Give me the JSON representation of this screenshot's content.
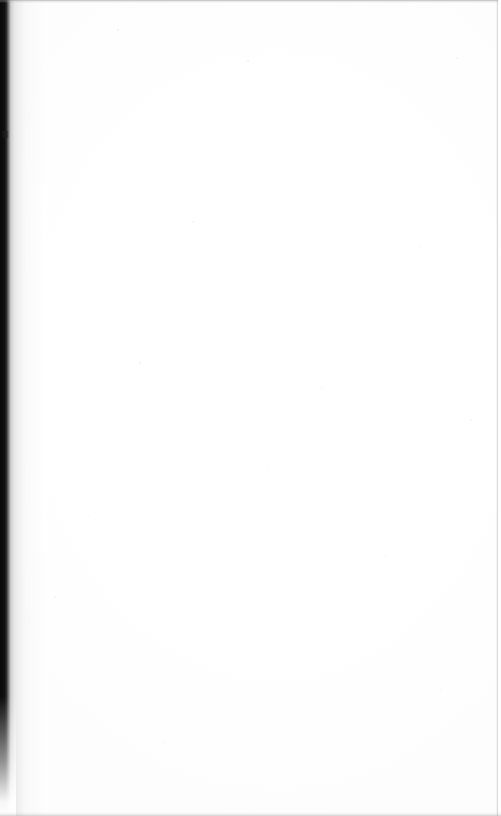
{
  "page": {
    "kind": "scanned-document-page",
    "content_text": "",
    "is_blank": true,
    "width": 501,
    "height": 816
  },
  "artifacts": {
    "gutter_shadow": {
      "name": "left-gutter-shadow",
      "color": "#0a0a0a",
      "edge": "left"
    },
    "gutter_notch": {
      "name": "gutter-notch",
      "color": "#080808"
    },
    "top_edge_line": {
      "name": "top-edge-line",
      "color": "#787a7e"
    },
    "bottom_edge_line": {
      "name": "bottom-edge-line",
      "color": "#96989c"
    },
    "right_edge_line": {
      "name": "right-edge-line",
      "color": "#8e9094"
    },
    "paper": {
      "name": "paper-surface",
      "color": "#ffffff"
    },
    "speckle": {
      "name": "scan-speckle",
      "color": "#d2d2d6"
    }
  }
}
